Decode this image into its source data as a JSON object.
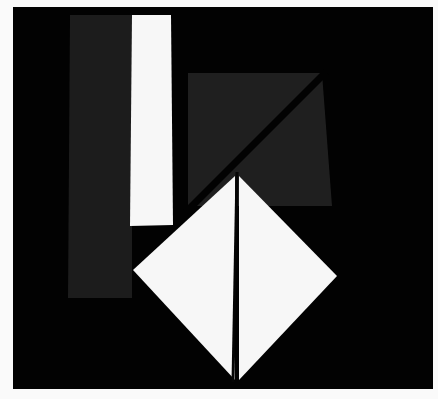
{
  "image": {
    "description": "Photograph of an abstract geometric composition: white and dark gray paper shapes on a black ground",
    "width": 438,
    "height": 399
  },
  "colors": {
    "page_background": "#fafafa",
    "frame_black": "#020202",
    "dark_gray": "#1c1c1c",
    "dark_gray_quad": "#1f1f1f",
    "white_shape": "#f7f7f7",
    "split_line": "#050505"
  },
  "shapes": {
    "frame": {
      "x": 13,
      "y": 7,
      "w": 420,
      "h": 382
    },
    "gray_strip": {
      "points": "70,15 132,15 132,298 68,298"
    },
    "white_strip": {
      "points": "132,15 171,15 173,225 130,226"
    },
    "gray_quad": {
      "points": "188,73 322,73 332,206 188,206"
    },
    "quad_diagonal_cut": {
      "x1": 326,
      "y1": 72,
      "x2": 186,
      "y2": 212,
      "stroke_width": 7
    },
    "diamond_left_half": {
      "points": "235,176 235,380 133,270"
    },
    "diamond_right_half": {
      "points": "239,176 337,276 239,380"
    },
    "diamond_split_line": {
      "x1": 237,
      "y1": 172,
      "x2": 233,
      "y2": 382,
      "stroke_width": 3
    }
  }
}
